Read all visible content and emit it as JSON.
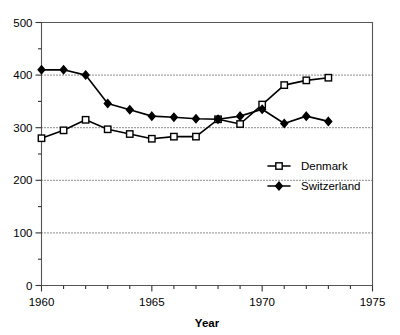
{
  "chart_data": {
    "type": "line",
    "title": "",
    "subtitle": "",
    "xlabel": "Year",
    "ylabel": "",
    "xlim": [
      1960,
      1975
    ],
    "ylim": [
      0,
      500
    ],
    "x": [
      1960,
      1961,
      1962,
      1963,
      1964,
      1965,
      1966,
      1967,
      1968,
      1969,
      1970,
      1971,
      1972,
      1973
    ],
    "xticks": [
      1960,
      1961,
      1962,
      1963,
      1964,
      1965,
      1966,
      1967,
      1968,
      1969,
      1970,
      1971,
      1972,
      1973,
      1974,
      1975
    ],
    "xtick_labels": [
      "1960",
      "",
      "",
      "",
      "",
      "1965",
      "",
      "",
      "",
      "",
      "1970",
      "",
      "",
      "",
      "",
      "1975"
    ],
    "yticks": [
      0,
      50,
      100,
      150,
      200,
      250,
      300,
      350,
      400,
      450,
      500
    ],
    "ytick_labels": [
      "0",
      "",
      "100",
      "",
      "200",
      "",
      "300",
      "",
      "400",
      "",
      "500"
    ],
    "gridlines_y": [
      100,
      200,
      300,
      400
    ],
    "grid": "horizontal-dotted",
    "legend_position": "center-right",
    "series": [
      {
        "name": "Denmark",
        "marker": "open-square",
        "color": "#000000",
        "values": [
          280,
          295,
          315,
          297,
          288,
          279,
          283,
          283,
          316,
          307,
          344,
          381,
          390,
          395
        ]
      },
      {
        "name": "Switzerland",
        "marker": "filled-diamond",
        "color": "#000000",
        "values": [
          410,
          410,
          400,
          346,
          334,
          322,
          320,
          317,
          316,
          322,
          335,
          308,
          322,
          312
        ]
      }
    ]
  },
  "legend": {
    "items": [
      {
        "label": "Denmark",
        "marker": "open-square"
      },
      {
        "label": "Switzerland",
        "marker": "filled-diamond"
      }
    ]
  },
  "axis": {
    "x_title": "Year"
  }
}
